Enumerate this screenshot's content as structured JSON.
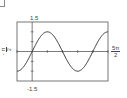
{
  "chart_data": {
    "type": "line",
    "title": "",
    "xlabel": "",
    "ylabel": "",
    "function": "y = sin(x)",
    "xlim": [
      "-π/2",
      "5π/2"
    ],
    "xlim_numeric": [
      -1.5708,
      7.854
    ],
    "ylim": [
      -1.5,
      1.5
    ],
    "x_tick_spacing": "π/2",
    "y_tick_spacing": 0.5,
    "grid": false,
    "legend": null,
    "series": [
      {
        "name": "sin(x)",
        "x": [
          "-π/2",
          "0",
          "π/2",
          "π",
          "3π/2",
          "2π",
          "5π/2"
        ],
        "x_numeric": [
          -1.5708,
          0,
          1.5708,
          3.1416,
          4.7124,
          6.2832,
          7.854
        ],
        "values": [
          -1,
          0,
          1,
          0,
          -1,
          0,
          1
        ]
      }
    ],
    "labels": {
      "y_max": "1.5",
      "y_min": "-1.5",
      "x_min_num": "π",
      "x_min_den": "2",
      "x_min_sign": "-",
      "x_max_num": "5π",
      "x_max_den": "2"
    }
  },
  "colors": {
    "frame": "#555555",
    "curve": "#333333",
    "axes": "#444444"
  }
}
